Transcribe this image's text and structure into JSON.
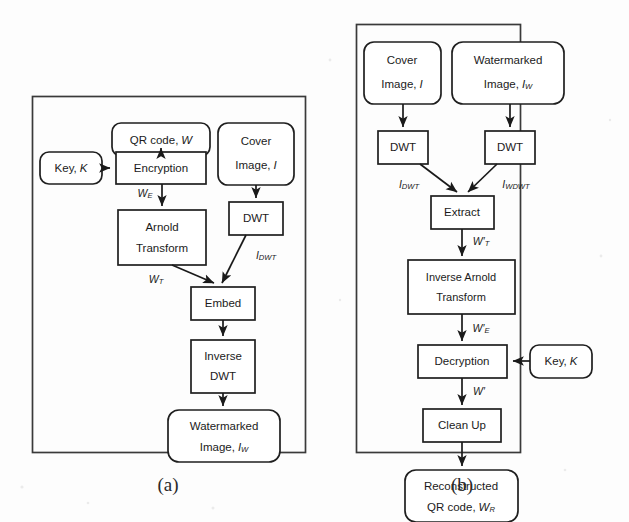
{
  "figure": {
    "kind": "flowchart",
    "panel_count": 2,
    "captions": [
      {
        "id": "caption-a",
        "label": "(a)"
      },
      {
        "id": "caption-b",
        "label": "(b)"
      }
    ]
  },
  "panel_a": {
    "caption": "(a)",
    "nodes": {
      "qr_code": {
        "line1": "QR code,",
        "var": "W",
        "shape": "terminator"
      },
      "cover_image": {
        "line1": "Cover",
        "line2": "Image,",
        "var": "I",
        "shape": "terminator"
      },
      "key": {
        "line1": "Key,",
        "var": "K",
        "shape": "terminator"
      },
      "encryption": {
        "line1": "Encryption",
        "shape": "process"
      },
      "dwt": {
        "line1": "DWT",
        "shape": "process"
      },
      "arnold_transform": {
        "line1": "Arnold",
        "line2": "Transform",
        "shape": "process"
      },
      "embed": {
        "line1": "Embed",
        "shape": "process"
      },
      "inverse_dwt": {
        "line1": "Inverse",
        "line2": "DWT",
        "shape": "process"
      },
      "watermarked_image": {
        "line1": "Watermarked",
        "line2": "Image,",
        "var": "I",
        "sub": "W",
        "shape": "terminator"
      }
    },
    "edge_labels": {
      "w_e": {
        "base": "W",
        "sub": "E"
      },
      "w_t": {
        "base": "W",
        "sub": "T"
      },
      "i_dwt": {
        "base": "I",
        "sub": "DWT"
      }
    }
  },
  "panel_b": {
    "caption": "(b)",
    "nodes": {
      "cover_image": {
        "line1": "Cover",
        "line2": "Image,",
        "var": "I",
        "shape": "terminator"
      },
      "watermarked_image": {
        "line1": "Watermarked",
        "line2": "Image,",
        "var": "I",
        "sub": "W",
        "shape": "terminator"
      },
      "dwt_left": {
        "line1": "DWT",
        "shape": "process"
      },
      "dwt_right": {
        "line1": "DWT",
        "shape": "process"
      },
      "extract": {
        "line1": "Extract",
        "shape": "process"
      },
      "inverse_arnold_transform": {
        "line1": "Inverse Arnold",
        "line2": "Transform",
        "shape": "process"
      },
      "decryption": {
        "line1": "Decryption",
        "shape": "process"
      },
      "key": {
        "line1": "Key,",
        "var": "K",
        "shape": "terminator"
      },
      "clean_up": {
        "line1": "Clean Up",
        "shape": "process"
      },
      "reconstructed_qr": {
        "line1": "Reconstructed",
        "line2": "QR code,",
        "var": "W",
        "sub": "R",
        "shape": "terminator"
      }
    },
    "edge_labels": {
      "i_dwt": {
        "base": "I",
        "sub": "DWT"
      },
      "i_wdwt": {
        "base": "I",
        "sub": "WDWT"
      },
      "w_prime_t": {
        "base": "W",
        "prime": "′",
        "sub": "T"
      },
      "w_prime_e": {
        "base": "W",
        "prime": "′",
        "sub": "E"
      },
      "w_prime": {
        "base": "W",
        "prime": "′",
        "sub": ""
      }
    }
  },
  "colors": {
    "background": "#fdfdfd",
    "stroke": "#1f1f1f",
    "frame_stroke": "#3a3a3a",
    "text": "#1b1b1b",
    "caption_text": "#2a2a2a"
  }
}
